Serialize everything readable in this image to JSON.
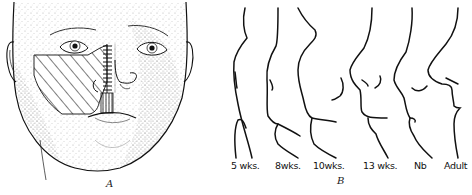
{
  "figure": {
    "panels": [
      {
        "id": "A",
        "label": "A",
        "subject": "frontal view of infant face with hatched regions over left cheek, nose and upper lip"
      },
      {
        "id": "B",
        "label": "B",
        "subject": "facial profile outlines at successive developmental stages",
        "stages": [
          {
            "label": "5  wks."
          },
          {
            "label": "8wks."
          },
          {
            "label": "10wks."
          },
          {
            "label": "13 wks."
          },
          {
            "label": "Nb"
          },
          {
            "label": "Adult"
          }
        ]
      }
    ],
    "colors": {
      "ink": "#111111",
      "background": "#ffffff",
      "stipple": "#555555"
    }
  }
}
